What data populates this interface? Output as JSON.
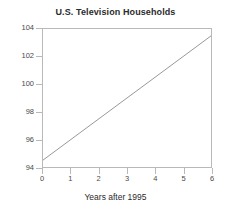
{
  "chart_data": {
    "type": "line",
    "title": "U.S. Television Households",
    "subtitle": "",
    "xlabel": "Years after 1995",
    "ylabel": "",
    "xlim": [
      0,
      6
    ],
    "ylim": [
      94,
      104
    ],
    "xticks": [
      0,
      1,
      2,
      3,
      4,
      5,
      6
    ],
    "xtick_labels": [
      "0",
      "1",
      "2",
      "3",
      "4",
      "5",
      "6"
    ],
    "yticks": [
      94,
      96,
      98,
      100,
      102,
      104
    ],
    "ytick_labels": [
      "94",
      "96",
      "98",
      "100",
      "102",
      "104"
    ],
    "grid": false,
    "legend": null,
    "legend_position": "none",
    "annotations": [],
    "series": [
      {
        "name": "U.S. Television Households",
        "x": [
          0,
          1,
          2,
          3,
          4,
          5,
          6
        ],
        "values": [
          94.5,
          96.0,
          97.5,
          99.0,
          100.5,
          102.0,
          103.5
        ],
        "color": "#8c8c8c",
        "line_width": 1,
        "markers": false
      }
    ]
  },
  "style": {
    "background_color": "#ffffff",
    "axis_color": "#b9b9b9",
    "text_color": "#2b2b2b",
    "tick_label_color": "#4a4a4a",
    "line_color": "#8c8c8c"
  }
}
